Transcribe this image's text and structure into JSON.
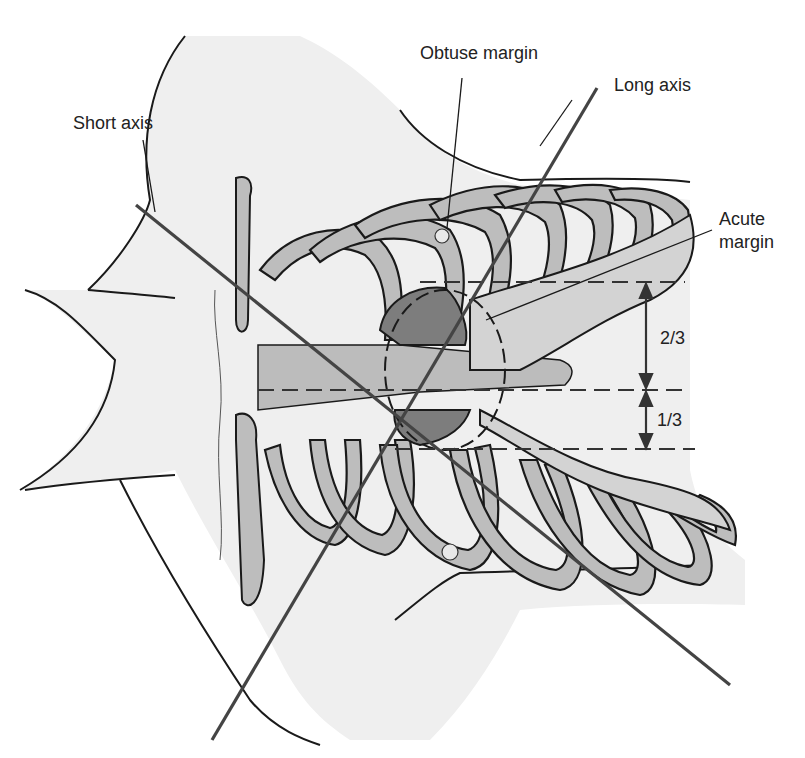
{
  "figure": {
    "type": "anatomical-diagram",
    "labels": {
      "obtuse_margin": "Obtuse margin",
      "long_axis": "Long axis",
      "short_axis": "Short axis",
      "acute_margin_line1": "Acute",
      "acute_margin_line2": "margin",
      "two_thirds": "2/3",
      "one_third": "1/3"
    },
    "colors": {
      "background": "#ffffff",
      "skin": "#ececec",
      "bone": "#b9b9b9",
      "bone_light": "#d9d9d9",
      "heart_dark": "#7d7d7d",
      "outline": "#1a1a1a",
      "axis_line": "#444444"
    }
  }
}
